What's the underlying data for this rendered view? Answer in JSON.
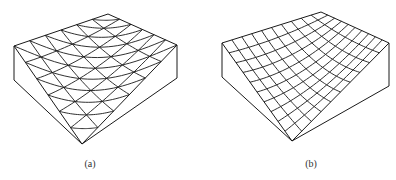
{
  "figure": {
    "panels": [
      {
        "id": "a",
        "caption": "(a)",
        "description": "Block with triangular mesh on top surface",
        "mesh_type": "triangular",
        "grid_divisions": 6
      },
      {
        "id": "b",
        "caption": "(b)",
        "description": "Block with curved quadrilateral mesh on top surface",
        "mesh_type": "curved-quadrilateral",
        "grid_divisions": 10
      }
    ],
    "line_color": "#1a1a1a",
    "background": "#ffffff"
  }
}
